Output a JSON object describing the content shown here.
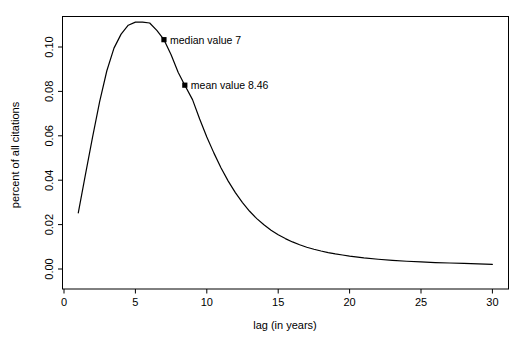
{
  "chart_data": {
    "type": "line",
    "title": "",
    "subtitle": "",
    "xlabel": "lag (in years)",
    "ylabel": "percent of all citations",
    "xlim": [
      0,
      31
    ],
    "ylim": [
      0.0,
      0.1155
    ],
    "grid": false,
    "legend": "none",
    "xticks": [
      "0",
      "5",
      "10",
      "15",
      "20",
      "25",
      "30"
    ],
    "xtick_values": [
      0,
      5,
      10,
      15,
      20,
      25,
      30
    ],
    "yticks": [
      "0.00",
      "0.02",
      "0.04",
      "0.06",
      "0.08",
      "0.10"
    ],
    "ytick_values": [
      0.0,
      0.02,
      0.04,
      0.06,
      0.08,
      0.1
    ],
    "series": [
      {
        "name": "citation lag distribution",
        "color": "#000000",
        "x": [
          1,
          1.5,
          2,
          2.5,
          3,
          3.5,
          4,
          4.5,
          5,
          5.5,
          6,
          6.5,
          7,
          7.5,
          8,
          8.46,
          9,
          9.5,
          10,
          10.5,
          11,
          11.5,
          12,
          12.5,
          13,
          13.5,
          14,
          14.5,
          15,
          15.5,
          16,
          16.5,
          17,
          17.5,
          18,
          18.5,
          19,
          19.5,
          20,
          21,
          22,
          23,
          24,
          25,
          26,
          27,
          28,
          29,
          30
        ],
        "values": [
          0.0253,
          0.0425,
          0.0594,
          0.0755,
          0.0893,
          0.0995,
          0.1058,
          0.1098,
          0.1112,
          0.1112,
          0.1108,
          0.1075,
          0.1033,
          0.0965,
          0.0885,
          0.0828,
          0.0763,
          0.0676,
          0.0595,
          0.0522,
          0.0455,
          0.0396,
          0.0344,
          0.0299,
          0.026,
          0.0227,
          0.0199,
          0.0175,
          0.0154,
          0.0137,
          0.0122,
          0.0109,
          0.0098,
          0.0089,
          0.0081,
          0.0074,
          0.0068,
          0.0063,
          0.0058,
          0.005,
          0.0044,
          0.0039,
          0.0035,
          0.0032,
          0.0029,
          0.0027,
          0.0025,
          0.0023,
          0.0021
        ]
      }
    ],
    "annotations": [
      {
        "name": "median",
        "label": "median value 7",
        "x": 7,
        "y": 0.1033,
        "marker": "filled-square"
      },
      {
        "name": "mean",
        "label": "mean value 8.46",
        "x": 8.46,
        "y": 0.0828,
        "marker": "filled-square"
      }
    ]
  }
}
